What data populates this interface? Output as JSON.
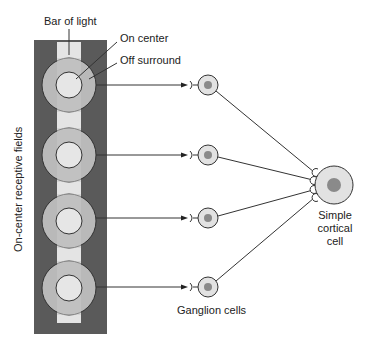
{
  "labels": {
    "bar_of_light": "Bar of light",
    "on_center": "On center",
    "off_surround": "Off surround",
    "receptive_fields": "On-center receptive fields",
    "ganglion_cells": "Ganglion cells",
    "cortical_cell_line1": "Simple",
    "cortical_cell_line2": "cortical",
    "cortical_cell_line3": "cell"
  },
  "colors": {
    "panel": "#5a5a5a",
    "bar": "#e4e4e4",
    "surround": "#b9b9b9",
    "center": "#e6e6e6",
    "cell_fill": "#e2e2e2",
    "nucleus": "#8a8a8a",
    "line": "#333333"
  },
  "receptive_fields": [
    {
      "cy": 85
    },
    {
      "cy": 155
    },
    {
      "cy": 218
    },
    {
      "cy": 287
    }
  ],
  "ganglion_cells": [
    {
      "cy": 85
    },
    {
      "cy": 155
    },
    {
      "cy": 218
    },
    {
      "cy": 287
    }
  ]
}
